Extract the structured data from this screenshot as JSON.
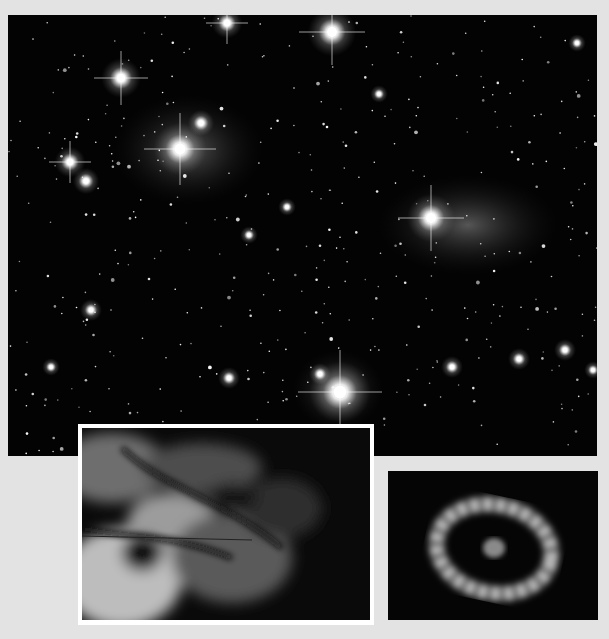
{
  "page": {
    "background": "#e3e3e3"
  },
  "images": [
    {
      "id": "starfield",
      "subject": "open star cluster with reflection nebulosity",
      "tone": "black-and-white"
    },
    {
      "id": "nebula-inset",
      "subject": "turbulent gas cloud / nebula close-up",
      "tone": "black-and-white",
      "border": "#ffffff"
    },
    {
      "id": "ring-inset",
      "subject": "bright elliptical ring with central glowing knot",
      "tone": "black-and-white"
    }
  ],
  "bright_stars": [
    {
      "x": 113,
      "y": 63,
      "r": 9
    },
    {
      "x": 219,
      "y": 8,
      "r": 7
    },
    {
      "x": 324,
      "y": 17,
      "r": 11
    },
    {
      "x": 172,
      "y": 134,
      "r": 12
    },
    {
      "x": 193,
      "y": 108,
      "r": 6
    },
    {
      "x": 62,
      "y": 147,
      "r": 7
    },
    {
      "x": 78,
      "y": 166,
      "r": 6
    },
    {
      "x": 423,
      "y": 203,
      "r": 11
    },
    {
      "x": 332,
      "y": 377,
      "r": 14
    },
    {
      "x": 312,
      "y": 359,
      "r": 5
    },
    {
      "x": 83,
      "y": 295,
      "r": 5
    },
    {
      "x": 241,
      "y": 220,
      "r": 4
    },
    {
      "x": 371,
      "y": 79,
      "r": 4
    },
    {
      "x": 279,
      "y": 192,
      "r": 4
    },
    {
      "x": 511,
      "y": 344,
      "r": 5
    },
    {
      "x": 557,
      "y": 335,
      "r": 5
    },
    {
      "x": 444,
      "y": 352,
      "r": 5
    },
    {
      "x": 221,
      "y": 363,
      "r": 5
    },
    {
      "x": 43,
      "y": 352,
      "r": 4
    },
    {
      "x": 585,
      "y": 355,
      "r": 4
    },
    {
      "x": 569,
      "y": 28,
      "r": 4
    }
  ]
}
